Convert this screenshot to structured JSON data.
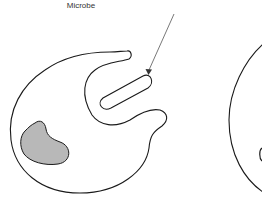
{
  "diagram": {
    "labels": {
      "microbe": "Microbe"
    },
    "colors": {
      "outline": "#1a1a1a",
      "nucleus_fill": "#b8b8b8",
      "arrow": "#555555",
      "background": "#ffffff"
    },
    "elements": [
      "phagocyte-cell-with-pseudopods",
      "nucleus",
      "microbe",
      "pointer-arrow",
      "second-cell-partial"
    ]
  }
}
